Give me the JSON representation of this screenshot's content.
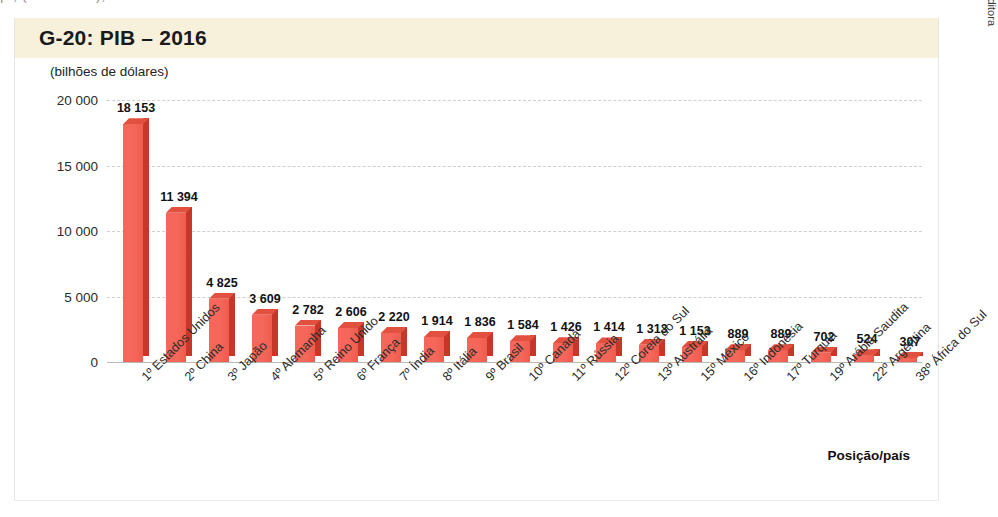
{
  "page": {
    "top_cut_text": "  p     , (Alemanha), e desde então tem ocorrido"
  },
  "figure": {
    "title": "G-20: PIB – 2016",
    "unit_label": "(bilhões de dólares)",
    "xaxis_title": "Posição/país",
    "credit": "Ericson Guilherme Luciano/Arquivo da editora",
    "colors": {
      "band": "#f7f1dc",
      "bar_front": "#f4675a",
      "bar_side": "#c63629",
      "bar_top": "#e2513f",
      "grid": "#cfcfcf"
    }
  },
  "chart_data": {
    "type": "bar",
    "title": "G-20: PIB – 2016",
    "subtitle": "(bilhões de dólares)",
    "xlabel": "Posição/país",
    "ylabel": "(bilhões de dólares)",
    "ylim": [
      0,
      20000
    ],
    "yticks": [
      0,
      5000,
      10000,
      15000,
      20000
    ],
    "ytick_labels": [
      "0",
      "5 000",
      "10 000",
      "15 000",
      "20 000"
    ],
    "grid": true,
    "legend": "none",
    "categories": [
      "1º Estados Unidos",
      "2º China",
      "3º Japão",
      "4º Alemanha",
      "5º Reino Unido",
      "6º França",
      "7º Índia",
      "8º Itália",
      "9º Brasil",
      "10º Canadá",
      "11º Rússia",
      "12º Coreia do Sul",
      "13º Austrália",
      "15º México",
      "16º Indonésia",
      "17º Turquia",
      "19º Arábia Saudita",
      "22º Argentina",
      "38º África do Sul"
    ],
    "values": [
      18153,
      11394,
      4825,
      3609,
      2782,
      2606,
      2220,
      1914,
      1836,
      1584,
      1426,
      1414,
      1313,
      1153,
      889,
      889,
      702,
      524,
      307
    ],
    "value_labels": [
      "18 153",
      "11 394",
      "4 825",
      "3 609",
      "2 782",
      "2 606",
      "2 220",
      "1 914",
      "1 836",
      "1 584",
      "1 426",
      "1 414",
      "1 313",
      "1 153",
      "889",
      "889",
      "702",
      "524",
      "307"
    ]
  }
}
